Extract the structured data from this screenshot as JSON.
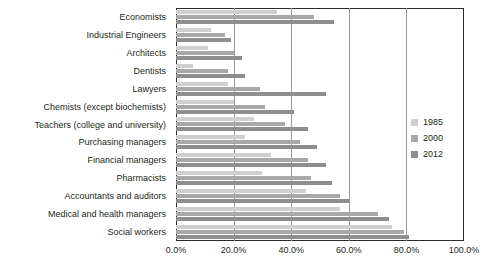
{
  "chart_data": {
    "type": "bar",
    "orientation": "horizontal",
    "title": "",
    "subtitle": "",
    "xlabel": "",
    "ylabel": "",
    "xlim": [
      0,
      100
    ],
    "grid": true,
    "legend_position": "right",
    "tick_labels": [
      "0.0%",
      "20.0%",
      "40.0%",
      "60.0%",
      "80.0%",
      "100.0%"
    ],
    "tick_values": [
      0,
      20,
      40,
      60,
      80,
      100
    ],
    "categories": [
      "Economists",
      "Industrial Engineers",
      "Architects",
      "Dentists",
      "Lawyers",
      "Chemists (except biochemists)",
      "Teachers (college and university)",
      "Purchasing managers",
      "Financial managers",
      "Pharmacists",
      "Accountants and auditors",
      "Medical and health managers",
      "Social workers"
    ],
    "series": [
      {
        "name": "1985",
        "color": "#cfcfcf",
        "values": [
          35,
          12,
          11,
          6,
          18,
          20,
          27,
          24,
          33,
          30,
          45,
          57,
          75
        ]
      },
      {
        "name": "2000",
        "color": "#a8a8a8",
        "values": [
          48,
          17,
          20,
          18,
          29,
          31,
          38,
          43,
          46,
          47,
          57,
          70,
          79
        ]
      },
      {
        "name": "2012",
        "color": "#8e8e8e",
        "values": [
          55,
          19,
          23,
          24,
          52,
          41,
          46,
          49,
          52,
          54,
          60,
          74,
          81
        ]
      }
    ]
  }
}
